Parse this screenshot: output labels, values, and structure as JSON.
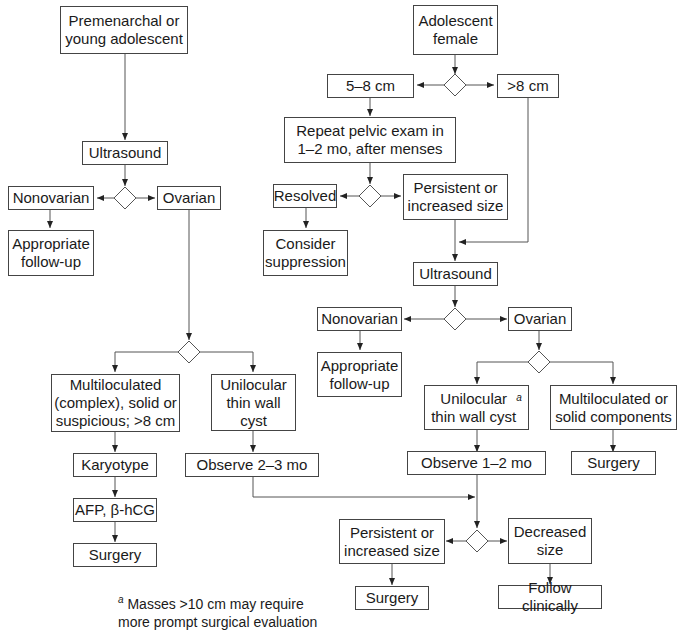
{
  "diagram": {
    "type": "flowchart",
    "left_branch": {
      "start": "Premenarchal or\nyoung adolescent",
      "ultrasound": "Ultrasound",
      "nonovarian": "Nonovarian",
      "appropriate_followup": "Appropriate\nfollow-up",
      "ovarian": "Ovarian",
      "multiloculated": "Multiloculated\n(complex), solid or\nsuspicious; >8 cm",
      "unilocular": "Unilocular\nthin wall\ncyst",
      "karyotype": "Karyotype",
      "afp": "AFP, β-hCG",
      "surgery": "Surgery",
      "observe": "Observe 2–3 mo"
    },
    "right_branch": {
      "start": "Adolescent\nfemale",
      "size_5_8": "5–8 cm",
      "size_gt8": ">8 cm",
      "repeat_exam": "Repeat pelvic exam in\n1–2 mo, after menses",
      "resolved": "Resolved",
      "consider_suppression": "Consider\nsuppression",
      "persistent": "Persistent or\nincreased size",
      "ultrasound": "Ultrasound",
      "nonovarian": "Nonovarian",
      "appropriate_followup": "Appropriate\nfollow-up",
      "ovarian": "Ovarian",
      "unilocular": "Unilocular\nthin wall cyst",
      "unilocular_sup": "a",
      "multiloculated": "Multiloculated or\nsolid components",
      "surgery_multi": "Surgery",
      "observe": "Observe 1–2 mo",
      "persistent_final": "Persistent or\nincreased size",
      "decreased": "Decreased\nsize",
      "surgery_final": "Surgery",
      "follow_clinically": "Follow clinically"
    },
    "footnote": {
      "marker": "a",
      "text": " Masses >10 cm may require\n  more prompt surgical evaluation"
    }
  }
}
